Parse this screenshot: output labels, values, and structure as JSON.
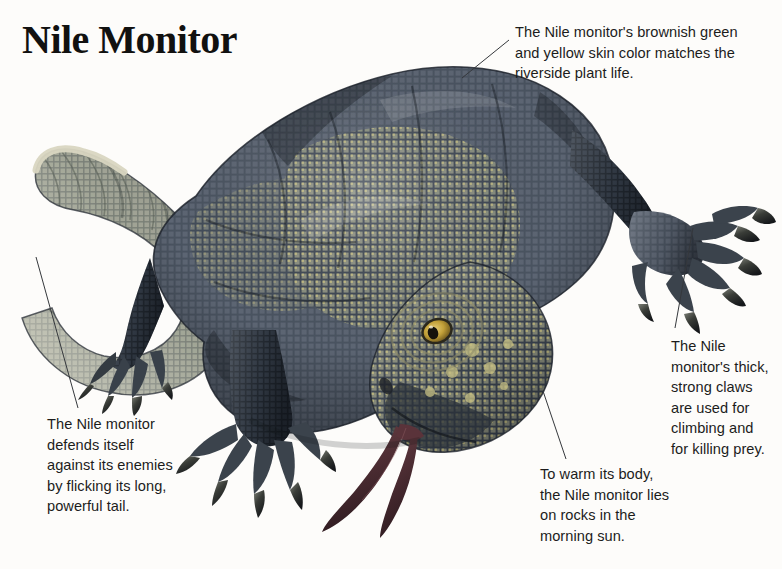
{
  "page": {
    "background_color": "#fdfcfa",
    "title": "Nile Monitor"
  },
  "subject": {
    "common_name": "Nile Monitor",
    "depiction": "full-body colour illustration of a Nile monitor lizard in side three-quarter view, head lowered to lower-right with forked tongue extended, long tail curled in a loop to the upper-left",
    "palette": {
      "scale_dark": "#2f3742",
      "scale_mid": "#566070",
      "scale_light": "#aeb3a6",
      "scale_yellow": "#c8c183",
      "scale_pale": "#e3e0cc",
      "claw_dark": "#2a2b28",
      "eye_iris": "#c8a43c",
      "eye_pupil": "#1a1710",
      "tongue": "#4a2b30",
      "tail_band_light": "#cfcdb4",
      "tail_tip": "#e8e5d2",
      "outline": "#1e2229"
    }
  },
  "callouts": [
    {
      "id": "skin",
      "name": "callout-skin-color",
      "text": "The Nile monitor's brownish green\nand yellow skin color matches the\nriverside plant life.",
      "leader": {
        "x1": 509,
        "y1": 40,
        "x2": 462,
        "y2": 78
      }
    },
    {
      "id": "claws",
      "name": "callout-claws",
      "text": "The Nile\nmonitor's thick,\nstrong claws\nare used for\nclimbing and\nfor killing prey.",
      "leader": {
        "x1": 693,
        "y1": 228,
        "x2": 675,
        "y2": 328
      }
    },
    {
      "id": "sun",
      "name": "callout-basking",
      "text": "To warm its body,\nthe Nile monitor lies\non rocks in the\nmorning sun.",
      "leader": {
        "x1": 543,
        "y1": 391,
        "x2": 566,
        "y2": 459
      }
    },
    {
      "id": "tail",
      "name": "callout-tail-defense",
      "text": "The Nile monitor\ndefends itself\nagainst its enemies\nby flicking its long,\npowerful tail.",
      "leader": {
        "x1": 36,
        "y1": 257,
        "x2": 78,
        "y2": 408
      }
    }
  ]
}
